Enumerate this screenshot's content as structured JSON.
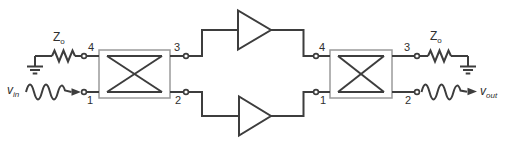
{
  "colors": {
    "background": "#ffffff",
    "wire": "#3d3d3d",
    "coupler_outline": "#9b9b9b",
    "text": "#2f2f2f"
  },
  "labels": {
    "input_source": {
      "main": "v",
      "sub": "in"
    },
    "output_signal": {
      "main": "v",
      "sub": "out"
    },
    "left_termination": {
      "main": "Z",
      "sub": "o"
    },
    "right_termination": {
      "main": "Z",
      "sub": "o"
    }
  },
  "couplers": [
    {
      "id": "input-hybrid",
      "ports": {
        "top_left": "4",
        "top_right": "3",
        "bottom_left": "1",
        "bottom_right": "2"
      }
    },
    {
      "id": "output-hybrid",
      "ports": {
        "top_left": "4",
        "top_right": "3",
        "bottom_left": "1",
        "bottom_right": "2"
      }
    }
  ],
  "icons": {
    "ground_left": "ground-symbol",
    "ground_right": "ground-symbol",
    "resistor_left": "resistor-zigzag",
    "resistor_right": "resistor-zigzag",
    "amplifier_top": "amplifier-triangle",
    "amplifier_bottom": "amplifier-triangle",
    "source_wave_left": "sine-wave",
    "output_wave_right": "sine-wave",
    "arrow_in": "right-arrowhead",
    "arrow_out": "right-arrowhead"
  }
}
